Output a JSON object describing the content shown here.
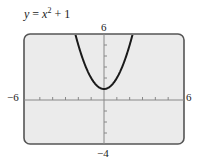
{
  "chart_data": {
    "type": "line",
    "function": "y = x^2 + 1",
    "xlabel": "",
    "ylabel": "",
    "xlim": [
      -6,
      6
    ],
    "ylim": [
      -4,
      6
    ],
    "x_tick_step": 1,
    "y_tick_step": 1,
    "window_labels": {
      "xmin": "−6",
      "xmax": "6",
      "ymin": "−4",
      "ymax": "6"
    },
    "grid": false,
    "legend": null,
    "x": [
      -2.24,
      -2,
      -1.5,
      -1,
      -0.5,
      0,
      0.5,
      1,
      1.5,
      2,
      2.24
    ],
    "series": [
      {
        "name": "y = x^2 + 1",
        "values": [
          6.0,
          5,
          3.25,
          2,
          1.25,
          1,
          1.25,
          2,
          3.25,
          5,
          6.0
        ]
      }
    ],
    "colors": {
      "background": "#ebebeb",
      "frame": "#555555",
      "curve": "#1a1a1a",
      "axes": "#888888"
    }
  },
  "title": {
    "lhs": "y",
    "eq": " = ",
    "base": "x",
    "exp": "2",
    "rest": " + 1"
  },
  "labels": {
    "ymax": "6",
    "ymin": "−4",
    "xmin": "−6",
    "xmax": "6"
  }
}
